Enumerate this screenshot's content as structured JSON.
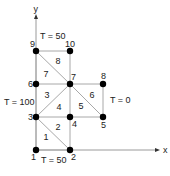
{
  "diagram": {
    "title": "",
    "axes": {
      "x_label": "x",
      "y_label": "y",
      "origin": [
        36,
        150
      ],
      "x_end": [
        160,
        150
      ],
      "y_end": [
        36,
        14
      ]
    },
    "colors": {
      "edge": "#a8a8a8",
      "axis": "#9a9a9a",
      "node": "#000000",
      "text": "#222222"
    },
    "nodes": [
      {
        "id": "1",
        "x": 36,
        "y": 150,
        "label_dx": -5,
        "label_dy": 10
      },
      {
        "id": "2",
        "x": 70,
        "y": 150,
        "label_dx": 1,
        "label_dy": 10
      },
      {
        "id": "3",
        "x": 36,
        "y": 117,
        "label_dx": -8,
        "label_dy": 3
      },
      {
        "id": "4",
        "x": 70,
        "y": 117,
        "label_dx": 2,
        "label_dy": 10
      },
      {
        "id": "5",
        "x": 103,
        "y": 117,
        "label_dx": -2,
        "label_dy": 11
      },
      {
        "id": "6",
        "x": 36,
        "y": 84,
        "label_dx": -8,
        "label_dy": 3
      },
      {
        "id": "7",
        "x": 70,
        "y": 84,
        "label_dx": 1,
        "label_dy": -4
      },
      {
        "id": "8",
        "x": 103,
        "y": 84,
        "label_dx": -2,
        "label_dy": -5
      },
      {
        "id": "9",
        "x": 36,
        "y": 51,
        "label_dx": -6,
        "label_dy": -4
      },
      {
        "id": "10",
        "x": 70,
        "y": 51,
        "label_dx": -5,
        "label_dy": -4
      }
    ],
    "edges": [
      [
        "1",
        "2"
      ],
      [
        "1",
        "3"
      ],
      [
        "2",
        "4"
      ],
      [
        "3",
        "2"
      ],
      [
        "3",
        "4"
      ],
      [
        "3",
        "6"
      ],
      [
        "3",
        "7"
      ],
      [
        "4",
        "7"
      ],
      [
        "4",
        "5"
      ],
      [
        "7",
        "5"
      ],
      [
        "5",
        "8"
      ],
      [
        "7",
        "8"
      ],
      [
        "6",
        "7"
      ],
      [
        "6",
        "9"
      ],
      [
        "9",
        "7"
      ],
      [
        "9",
        "10"
      ],
      [
        "10",
        "7"
      ]
    ],
    "elements": [
      {
        "id": "1",
        "x": 46,
        "y": 140
      },
      {
        "id": "2",
        "x": 58,
        "y": 130
      },
      {
        "id": "3",
        "x": 47,
        "y": 98
      },
      {
        "id": "4",
        "x": 59,
        "y": 110
      },
      {
        "id": "5",
        "x": 81,
        "y": 109
      },
      {
        "id": "6",
        "x": 92,
        "y": 98
      },
      {
        "id": "7",
        "x": 46,
        "y": 77
      },
      {
        "id": "8",
        "x": 58,
        "y": 64
      }
    ],
    "boundary_conditions": [
      {
        "label": "T = 50",
        "x": 40,
        "y": 39
      },
      {
        "label": "T = 100",
        "x": 4,
        "y": 105
      },
      {
        "label": "T = 0",
        "x": 110,
        "y": 103
      },
      {
        "label": "T = 50",
        "x": 41,
        "y": 163
      }
    ]
  }
}
